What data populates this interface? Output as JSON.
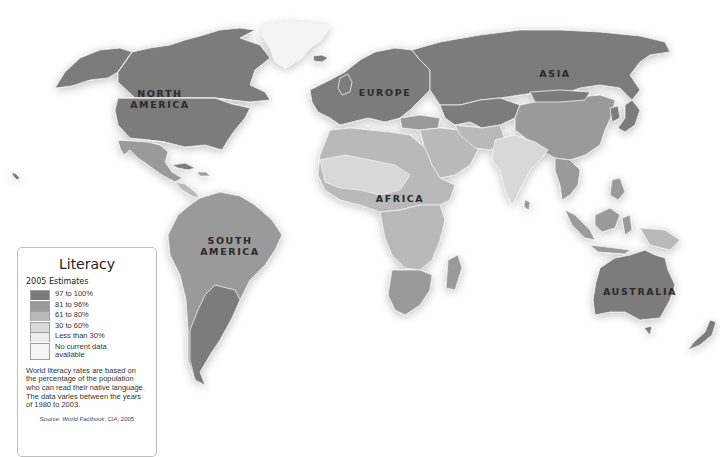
{
  "map": {
    "title": "Literacy",
    "subtitle": "2005 Estimates",
    "continent_labels": {
      "north_america": [
        "NORTH",
        "AMERICA"
      ],
      "europe": "EUROPE",
      "asia": "ASIA",
      "africa": "AFRICA",
      "south_america": [
        "SOUTH",
        "AMERICA"
      ],
      "australia": "AUSTRALIA"
    }
  },
  "legend": {
    "title": "Literacy",
    "subtitle": "2005 Estimates",
    "items": [
      {
        "label": "97 to 100%",
        "color": "#7b7b7b"
      },
      {
        "label": "81 to 96%",
        "color": "#9a9a9a"
      },
      {
        "label": "61 to 80%",
        "color": "#b9b9b9"
      },
      {
        "label": "30 to 60%",
        "color": "#d8d8d8"
      },
      {
        "label": "Less than 30%",
        "color": "#ececec"
      },
      {
        "label": "No current data available",
        "color": "#f4f4f4"
      }
    ],
    "note": "World literacy rates are based on the percentage of the population who can read their native language. The data varies between the years of 1980 to 2003.",
    "source_prefix": "Source: ",
    "source_title": "World Factbook",
    "source_suffix": ", CIA, 2005"
  }
}
